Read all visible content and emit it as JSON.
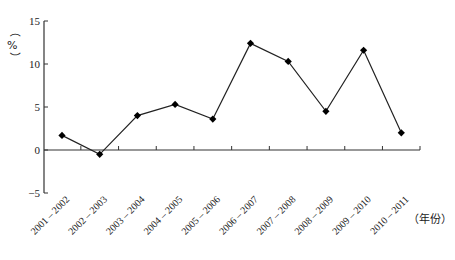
{
  "chart_data": {
    "type": "line",
    "title": "",
    "xlabel": "（年份）",
    "ylabel": "（%）",
    "categories": [
      "2001 – 2002",
      "2002 – 2003",
      "2003 – 2004",
      "2004 – 2005",
      "2005 – 2006",
      "2006 – 2007",
      "2007 – 2008",
      "2008 – 2009",
      "2009 – 2010",
      "2010 – 2011"
    ],
    "series": [
      {
        "name": "growth",
        "values": [
          1.7,
          -0.5,
          4.0,
          5.3,
          3.6,
          12.4,
          10.3,
          4.5,
          11.6,
          2.0
        ],
        "marker": "diamond",
        "color": "#000000"
      }
    ],
    "yticks": [
      -5,
      0,
      5,
      10,
      15
    ],
    "ylim": [
      -5,
      15
    ],
    "grid": false,
    "legend": "none"
  },
  "axis": {
    "y_unit_open": "（",
    "y_unit_symbol": "%",
    "y_unit_close": "）",
    "x_unit": "（年份）"
  }
}
